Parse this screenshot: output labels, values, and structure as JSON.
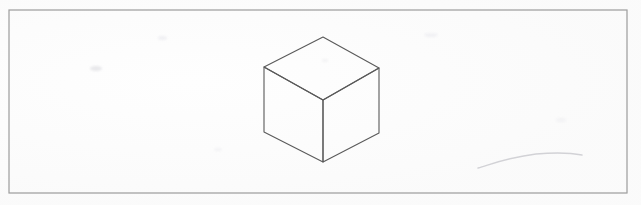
{
  "page": {
    "title": "Isometric cube line drawing",
    "width": 641,
    "height": 205,
    "background_color": "#fefefe",
    "media": "scanned paper"
  },
  "frame": {
    "name": "border rectangle",
    "x": 9,
    "y": 10,
    "width": 618,
    "height": 183,
    "stroke_color": "#9c9c9c",
    "stroke_width": 1.2,
    "fill": "none"
  },
  "drawing": {
    "label": "cube",
    "stroke_color": "#5a5a5a",
    "stroke_width": 1.1,
    "fill": "none",
    "projection": "isometric",
    "vertices": {
      "top_apex": {
        "x": 323,
        "y": 37
      },
      "top_left": {
        "x": 264,
        "y": 67
      },
      "top_right": {
        "x": 379,
        "y": 68
      },
      "center": {
        "x": 323,
        "y": 100
      },
      "bottom_left": {
        "x": 264,
        "y": 132
      },
      "bottom_right": {
        "x": 379,
        "y": 133
      },
      "bottom": {
        "x": 323,
        "y": 162
      }
    },
    "faces": {
      "top": "323,37 264,67 323,100 379,68",
      "left": "264,67 264,132 323,162 323,100",
      "right": "379,68 379,133 323,162 323,100"
    },
    "edges": [
      "top_apex-top_left",
      "top_apex-top_right",
      "top_left-center",
      "top_right-center",
      "top_left-bottom_left",
      "top_right-bottom_right",
      "center-bottom",
      "bottom_left-bottom",
      "bottom_right-bottom"
    ]
  },
  "stray_mark": {
    "label": "faint pencil stroke",
    "path": "M 478 168 C 492 164, 510 157, 536 154 C 558 152, 572 153, 582 155",
    "stroke_color": "#d2d2d6",
    "stroke_width": 1.4
  },
  "smudges": [
    {
      "x": 90,
      "y": 66,
      "w": 12,
      "h": 5,
      "color": "rgba(226,226,230,0.75)"
    },
    {
      "x": 158,
      "y": 36,
      "w": 9,
      "h": 4,
      "color": "rgba(232,232,236,0.6)"
    },
    {
      "x": 424,
      "y": 33,
      "w": 14,
      "h": 4,
      "color": "rgba(234,234,238,0.55)"
    },
    {
      "x": 322,
      "y": 59,
      "w": 6,
      "h": 3,
      "color": "rgba(235,235,238,0.6)"
    },
    {
      "x": 556,
      "y": 118,
      "w": 10,
      "h": 4,
      "color": "rgba(236,236,240,0.5)"
    },
    {
      "x": 214,
      "y": 148,
      "w": 8,
      "h": 3,
      "color": "rgba(236,236,240,0.5)"
    }
  ]
}
